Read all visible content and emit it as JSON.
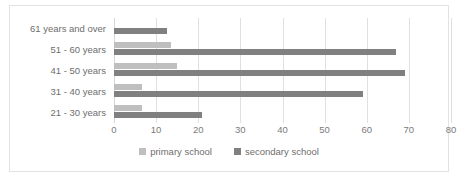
{
  "chart_data": {
    "type": "bar",
    "orientation": "horizontal",
    "title": "",
    "xlabel": "",
    "ylabel": "",
    "categories": [
      "21 - 30 years",
      "31 - 40 years",
      "41 - 50 years",
      "51 - 60 years",
      "61 years and over"
    ],
    "series": [
      {
        "name": "primary school",
        "color": "#bfbfbf",
        "values": [
          6.7,
          6.7,
          15,
          13.5,
          0
        ]
      },
      {
        "name": "secondary school",
        "color": "#808080",
        "values": [
          21,
          59,
          69,
          67,
          12.5
        ]
      }
    ],
    "xlim": [
      0,
      80
    ],
    "xticks": [
      0,
      10,
      20,
      30,
      40,
      50,
      60,
      70,
      80
    ],
    "xtick_labels": [
      "0",
      "10",
      "20",
      "30",
      "40",
      "50",
      "60",
      "70",
      "80"
    ],
    "grid": "vertical",
    "legend_position": "bottom",
    "legend": [
      {
        "label": "primary school",
        "color": "#bfbfbf"
      },
      {
        "label": "secondary school",
        "color": "#808080"
      }
    ]
  },
  "colors": {
    "primary_school": "#bfbfbf",
    "secondary_school": "#808080",
    "gridline": "#e0e0e0",
    "frame_border": "#e2e2e2",
    "label_text": "#6e6e6e",
    "background": "#ffffff"
  }
}
